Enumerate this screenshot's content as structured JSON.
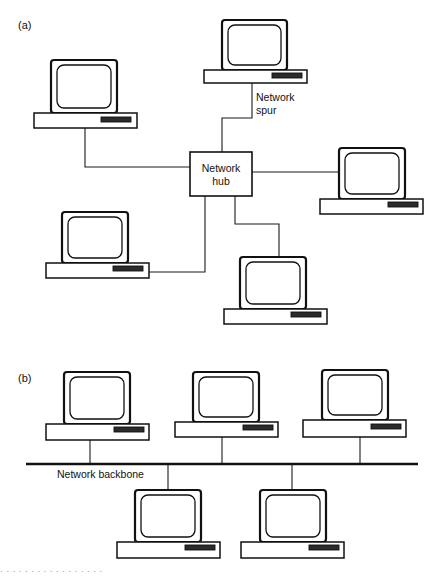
{
  "figure": {
    "panels": [
      {
        "id": "panel-a",
        "label": "(a)",
        "topology": "star",
        "hub": {
          "label_line1": "Network",
          "label_line2": "hub"
        },
        "annotations": [
          {
            "id": "network-spur",
            "line1": "Network",
            "line2": "spur"
          }
        ],
        "nodes": [
          {
            "id": "node-a-top-left",
            "name": "computer-top-left"
          },
          {
            "id": "node-a-top-center",
            "name": "computer-top-center"
          },
          {
            "id": "node-a-right",
            "name": "computer-right"
          },
          {
            "id": "node-a-bottom-left",
            "name": "computer-bottom-left"
          },
          {
            "id": "node-a-bottom-center",
            "name": "computer-bottom-center"
          }
        ],
        "node_count": 5
      },
      {
        "id": "panel-b",
        "label": "(b)",
        "topology": "bus",
        "annotations": [
          {
            "id": "network-backbone",
            "line1": "Network backbone"
          }
        ],
        "nodes": [
          {
            "id": "node-b-top-1",
            "name": "computer-top-1"
          },
          {
            "id": "node-b-top-2",
            "name": "computer-top-2"
          },
          {
            "id": "node-b-top-3",
            "name": "computer-top-3"
          },
          {
            "id": "node-b-bottom-1",
            "name": "computer-bottom-1"
          },
          {
            "id": "node-b-bottom-2",
            "name": "computer-bottom-2"
          }
        ],
        "node_count": 5
      }
    ],
    "caption": {
      "text": "· ·  ·  ·  ·  ·   ·   ·  ·  ·  · ·  ·   ·   ·  ·  ·"
    },
    "colors": {
      "ink": "#111111",
      "paper": "#ffffff",
      "slot": "#2b2b2b"
    }
  }
}
